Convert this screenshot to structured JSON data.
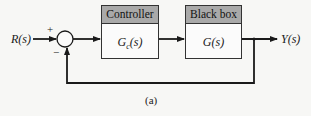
{
  "diagram": {
    "type": "feedback-control-block-diagram",
    "input_label": "R(s)",
    "output_label": "Y(s)",
    "summing_junction": {
      "plus_sign": "+",
      "minus_sign": "−"
    },
    "blocks": [
      {
        "header": "Controller",
        "transfer_fn": "G",
        "transfer_sub": "c",
        "transfer_arg": "(s)"
      },
      {
        "header": "Black box",
        "transfer_fn": "G(s)"
      }
    ],
    "caption": "(a)",
    "colors": {
      "line": "#1a1a1a",
      "header_fill": "#a9a9a9",
      "background": "#f7f7f5"
    }
  }
}
